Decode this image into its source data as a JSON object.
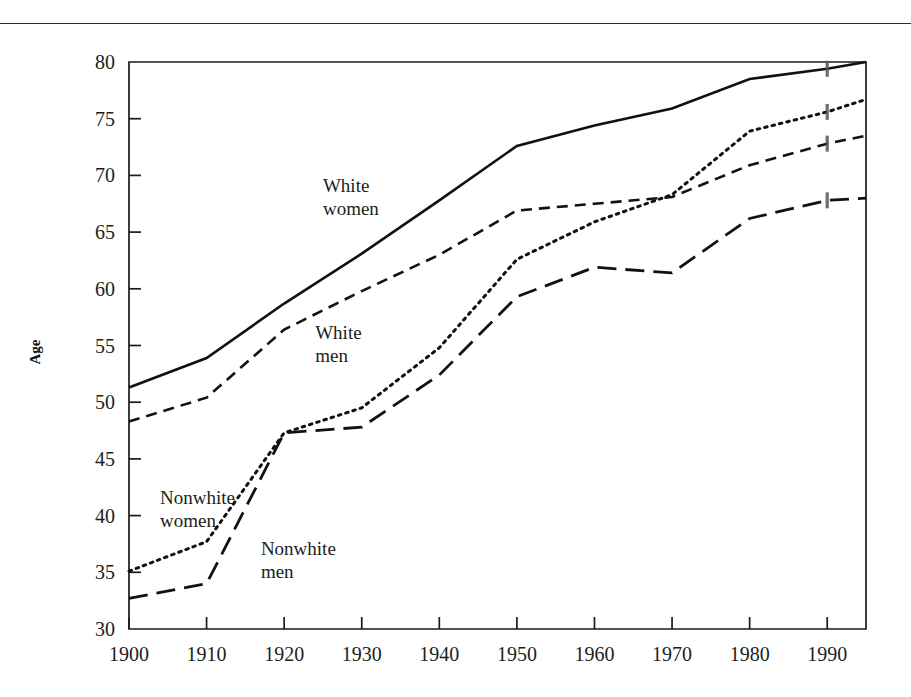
{
  "page": {
    "has_top_rule": true
  },
  "chart_data": {
    "type": "line",
    "title": "",
    "xlabel": "",
    "ylabel": "Age",
    "xlim": [
      1900,
      1995
    ],
    "ylim": [
      30,
      80
    ],
    "grid": false,
    "legend": "inline-labels",
    "x_ticks": [
      1900,
      1910,
      1920,
      1930,
      1940,
      1950,
      1960,
      1970,
      1980,
      1990
    ],
    "x_tick_labels": [
      "1900",
      "1910",
      "1920",
      "1930",
      "1940",
      "1950",
      "1960",
      "1970",
      "1980",
      "1990"
    ],
    "y_ticks": [
      30,
      35,
      40,
      45,
      50,
      55,
      60,
      65,
      70,
      75,
      80
    ],
    "y_tick_labels": [
      "30",
      "35",
      "40",
      "45",
      "50",
      "55",
      "60",
      "65",
      "70",
      "75",
      "80"
    ],
    "x": [
      1900,
      1910,
      1920,
      1930,
      1940,
      1950,
      1960,
      1970,
      1980,
      1990,
      1995
    ],
    "series": [
      {
        "name": "White women",
        "label": "White women",
        "style": "solid",
        "color": "#111111",
        "dash": "none",
        "width": 2.6,
        "values": [
          51.3,
          53.9,
          58.7,
          63.1,
          67.8,
          72.6,
          74.4,
          75.9,
          78.5,
          79.4,
          80.0
        ],
        "label_x": 1925,
        "label_y": 68.5
      },
      {
        "name": "White men",
        "label": "White men",
        "style": "dashed",
        "color": "#111111",
        "dash": "11,7",
        "width": 2.6,
        "values": [
          48.3,
          50.4,
          56.4,
          59.8,
          63.0,
          66.9,
          67.5,
          68.1,
          70.9,
          72.8,
          73.5
        ],
        "label_x": 1924,
        "label_y": 55.6
      },
      {
        "name": "Nonwhite women",
        "label": "Nonwhite women",
        "style": "dotted",
        "color": "#111111",
        "dash": "2.6,5",
        "width": 3.0,
        "values": [
          35.1,
          37.7,
          47.3,
          49.5,
          54.8,
          62.6,
          65.9,
          68.3,
          73.9,
          75.6,
          76.7
        ],
        "label_x": 1904,
        "label_y": 41.0
      },
      {
        "name": "Nonwhite men",
        "label": "Nonwhite men",
        "style": "long-dashed",
        "color": "#111111",
        "dash": "19,9",
        "width": 2.8,
        "values": [
          32.7,
          34.0,
          47.3,
          47.8,
          52.4,
          59.3,
          61.9,
          61.4,
          66.2,
          67.8,
          68.0
        ],
        "label_x": 1917,
        "label_y": 36.5
      }
    ],
    "end_markers": {
      "year": 1990,
      "present": true
    }
  }
}
